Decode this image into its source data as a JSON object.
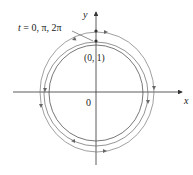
{
  "diagram": {
    "axes": {
      "x_label": "x",
      "y_label": "y",
      "origin_label": "0"
    },
    "point_label": "(0, 1)",
    "annotation": "t = 0, π, 2π",
    "annotation_parts": {
      "t": "t",
      "rest": " = 0, π, 2π"
    },
    "curves": [
      {
        "name": "inner",
        "rx": 47,
        "ry": 48
      },
      {
        "name": "middle",
        "rx": 52,
        "ry": 52
      },
      {
        "name": "outer",
        "rx": 57,
        "ry": 58
      }
    ],
    "colors": {
      "axis": "#333333",
      "curve": "#555555",
      "arrow": "#666666",
      "text": "#222222"
    }
  }
}
